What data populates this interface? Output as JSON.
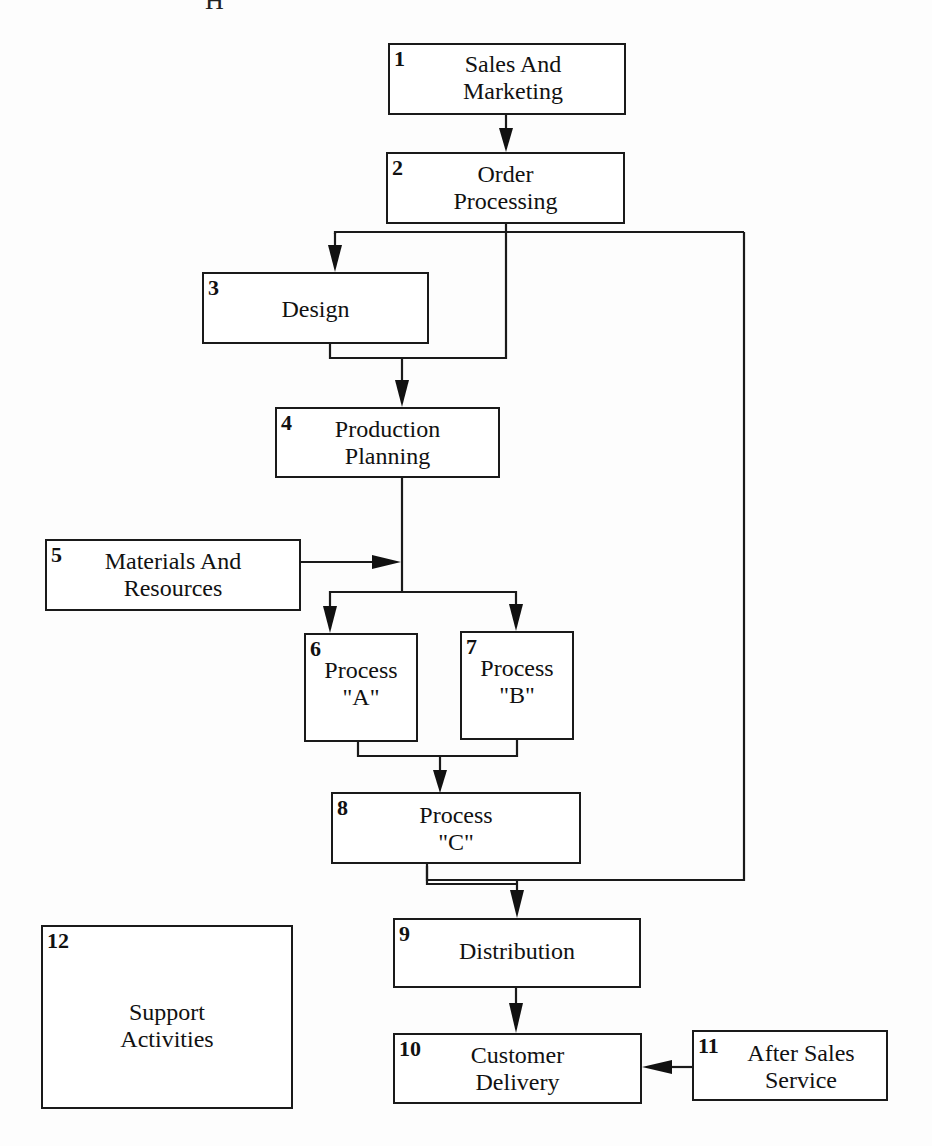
{
  "diagram": {
    "type": "flowchart",
    "clipped_top_text": "H",
    "boxes": [
      {
        "id": 1,
        "number": "1",
        "label": "Sales And\nMarketing"
      },
      {
        "id": 2,
        "number": "2",
        "label": "Order\nProcessing"
      },
      {
        "id": 3,
        "number": "3",
        "label": "Design"
      },
      {
        "id": 4,
        "number": "4",
        "label": "Production\nPlanning"
      },
      {
        "id": 5,
        "number": "5",
        "label": "Materials And\nResources"
      },
      {
        "id": 6,
        "number": "6",
        "label": "Process\n\"A\""
      },
      {
        "id": 7,
        "number": "7",
        "label": "Process\n\"B\""
      },
      {
        "id": 8,
        "number": "8",
        "label": "Process\n\"C\""
      },
      {
        "id": 9,
        "number": "9",
        "label": "Distribution"
      },
      {
        "id": 10,
        "number": "10",
        "label": "Customer\nDelivery"
      },
      {
        "id": 11,
        "number": "11",
        "label": "After Sales\nService"
      },
      {
        "id": 12,
        "number": "12",
        "label": "Support\nActivities"
      }
    ],
    "edges": [
      {
        "from": 1,
        "to": 2
      },
      {
        "from": 2,
        "to": 3
      },
      {
        "from": 2,
        "to": 4,
        "note": "bypass line merging with Design output"
      },
      {
        "from": 3,
        "to": 4
      },
      {
        "from": 2,
        "to": 9,
        "note": "long bypass loop on right side"
      },
      {
        "from": 4,
        "to": 6
      },
      {
        "from": 4,
        "to": 7
      },
      {
        "from": 5,
        "to": 6,
        "note": "joins production planning line"
      },
      {
        "from": 5,
        "to": 7,
        "note": "joins production planning line"
      },
      {
        "from": 6,
        "to": 8
      },
      {
        "from": 7,
        "to": 8
      },
      {
        "from": 8,
        "to": 9
      },
      {
        "from": 9,
        "to": 10
      },
      {
        "from": 11,
        "to": 10
      }
    ]
  }
}
